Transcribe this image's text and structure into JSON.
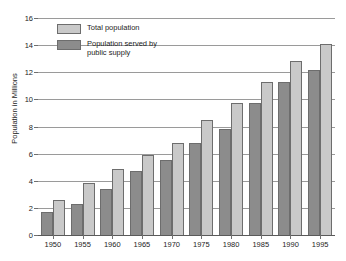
{
  "chart_data": {
    "type": "bar",
    "title": "",
    "xlabel": "",
    "ylabel": "Population in Millions",
    "ylim": [
      0,
      16
    ],
    "yticks": [
      0,
      2,
      4,
      6,
      8,
      10,
      12,
      14,
      16
    ],
    "grid": true,
    "legend_position": "top-left-inside",
    "categories": [
      "1950",
      "1955",
      "1960",
      "1965",
      "1970",
      "1975",
      "1980",
      "1985",
      "1990",
      "1995"
    ],
    "series": [
      {
        "name": "Population served by public supply",
        "legend_label": "Population served by\n   public supply",
        "color": "#8c8c8c",
        "values": [
          1.7,
          2.3,
          3.4,
          4.7,
          5.5,
          6.8,
          7.8,
          9.7,
          11.3,
          12.2
        ]
      },
      {
        "name": "Total population",
        "legend_label": "Total population",
        "color": "#c9c9c9",
        "values": [
          2.6,
          3.8,
          4.9,
          5.9,
          6.8,
          8.5,
          9.7,
          11.3,
          12.8,
          14.1
        ]
      }
    ]
  }
}
